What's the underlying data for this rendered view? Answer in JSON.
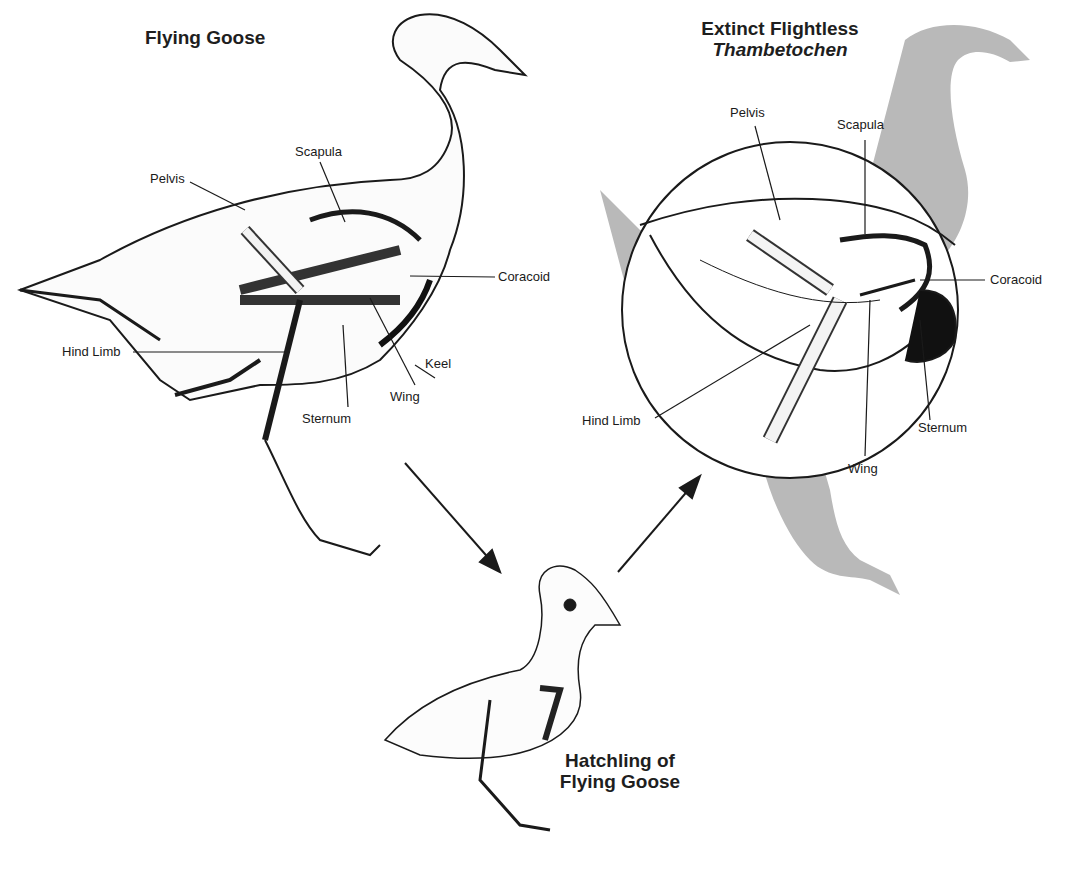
{
  "titles": {
    "flying_goose": "Flying Goose",
    "extinct_line1": "Extinct Flightless",
    "extinct_line2": "Thambetochen",
    "hatchling_line1": "Hatchling of",
    "hatchling_line2": "Flying Goose"
  },
  "flying_goose_labels": {
    "pelvis": "Pelvis",
    "scapula": "Scapula",
    "coracoid": "Coracoid",
    "hind_limb": "Hind Limb",
    "keel": "Keel",
    "wing": "Wing",
    "sternum": "Sternum"
  },
  "thambetochen_labels": {
    "pelvis": "Pelvis",
    "scapula": "Scapula",
    "coracoid": "Coracoid",
    "hind_limb": "Hind Limb",
    "sternum": "Sternum",
    "wing": "Wing"
  },
  "colors": {
    "ink": "#1a1a1a",
    "silhouette": "#b8b8b8",
    "bone": "#f4f4f4"
  }
}
